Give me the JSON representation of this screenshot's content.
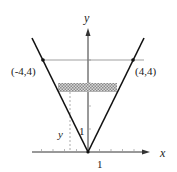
{
  "diagram": {
    "type": "coordinate-plot",
    "axes": {
      "x_label": "x",
      "y_label": "y",
      "x_tick_label": "1",
      "y_tick_label": "1"
    },
    "points": [
      {
        "label": "(-4,4)",
        "x": -4,
        "y": 4
      },
      {
        "label": "(4,4)",
        "x": 4,
        "y": 4
      }
    ],
    "curve": "y = |x| scaled (V through origin)",
    "horizontal_line": {
      "y": 4
    },
    "strip": {
      "label": "y",
      "description": "thin shaded horizontal slice at height y"
    },
    "colors": {
      "line": "#111111",
      "axis": "#333333",
      "strip": "#9a9a9a",
      "guide": "#888888"
    }
  }
}
